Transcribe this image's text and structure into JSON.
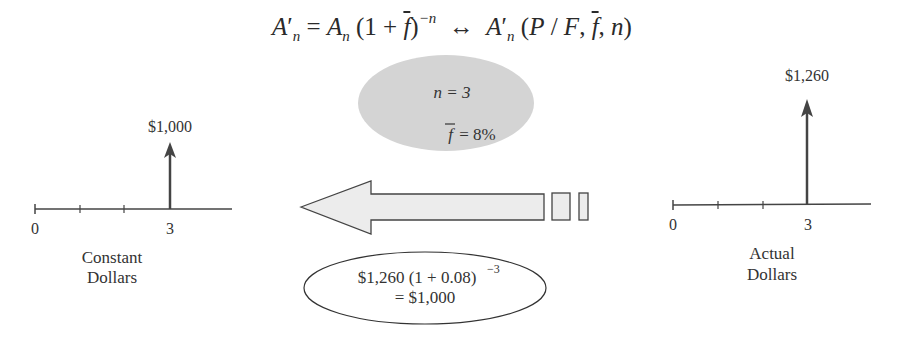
{
  "formula": {
    "lhs_A": "A",
    "lhs_prime": "′",
    "lhs_sub": "n",
    "eq": " = ",
    "rhs_A": "A",
    "rhs_sub": "n",
    "paren_open": " (1 + ",
    "fbar": "f",
    "paren_close": ")",
    "exponent": "−n",
    "equiv": "  ↔  ",
    "factor_A": "A",
    "factor_prime": "′",
    "factor_sub": "n",
    "factor_args_open": " (",
    "factor_P": "P",
    "factor_slash": " / ",
    "factor_F": "F",
    "factor_comma1": ", ",
    "factor_f": "f",
    "factor_comma2": ", ",
    "factor_n": "n",
    "factor_close": ")"
  },
  "left_diagram": {
    "amount": "$1,000",
    "tick_start": "0",
    "tick_end": "3",
    "label_line1": "Constant",
    "label_line2": "Dollars"
  },
  "right_diagram": {
    "amount": "$1,260",
    "tick_start": "0",
    "tick_end": "3",
    "label_line1": "Actual",
    "label_line2": "Dollars"
  },
  "params_bubble": {
    "n_line": "n = 3",
    "f_symbol": "f",
    "f_value": " = 8%"
  },
  "calc_bubble": {
    "line1": "$1,260 (1 + 0.08)",
    "line1_exp": "−3",
    "line2": "= $1,000"
  },
  "colors": {
    "bubble_fill": "#d4d4d4",
    "arrow_fill": "#ececec",
    "stroke": "#444444"
  }
}
